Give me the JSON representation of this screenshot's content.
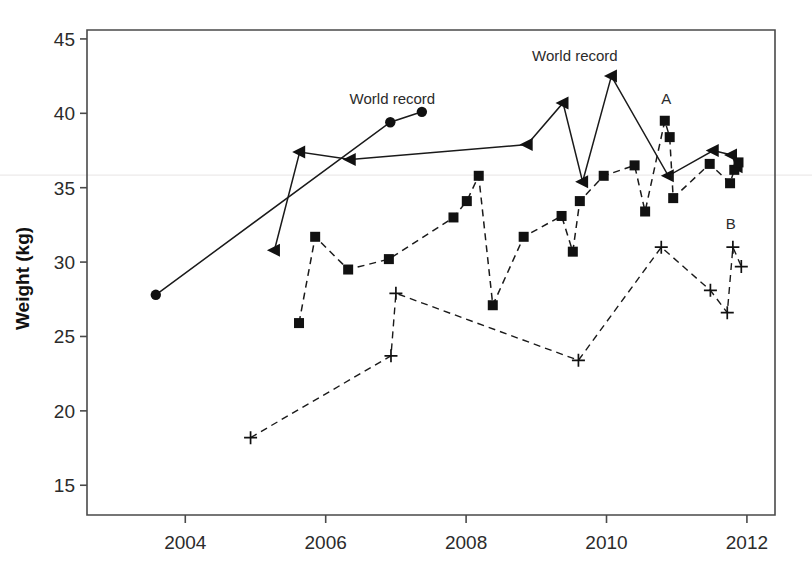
{
  "chart_data": {
    "type": "line",
    "title": "",
    "xlabel": "",
    "ylabel": "Weight (kg)",
    "xlim": [
      2002.6,
      2012.4
    ],
    "ylim": [
      13.0,
      45.6
    ],
    "xticks": [
      2004,
      2006,
      2008,
      2010,
      2012
    ],
    "xticklabels": [
      "2004",
      "2006",
      "2008",
      "2010",
      "2012"
    ],
    "yticks": [
      15,
      20,
      25,
      30,
      35,
      40,
      45
    ],
    "yticklabels": [
      "15",
      "20",
      "25",
      "30",
      "35",
      "40",
      "45"
    ],
    "grid": false,
    "legend": "none",
    "annotations": [
      {
        "text": "World record",
        "x": 2006.95,
        "y": 40.6,
        "target_series": "circles"
      },
      {
        "text": "World record",
        "x": 2009.55,
        "y": 43.5,
        "target_series": "triangles"
      },
      {
        "text": "A",
        "x": 2010.85,
        "y": 40.6,
        "target_series": "squares"
      },
      {
        "text": "B",
        "x": 2011.77,
        "y": 32.2,
        "target_series": "plus"
      }
    ],
    "series": [
      {
        "name": "circles",
        "marker": "circle",
        "linestyle": "solid",
        "color": "#111111",
        "points": [
          {
            "x": 2003.58,
            "y": 27.8
          },
          {
            "x": 2006.92,
            "y": 39.4
          },
          {
            "x": 2007.37,
            "y": 40.1
          }
        ]
      },
      {
        "name": "triangles",
        "marker": "left-triangle",
        "linestyle": "solid",
        "color": "#111111",
        "points": [
          {
            "x": 2005.27,
            "y": 30.8
          },
          {
            "x": 2005.63,
            "y": 37.4
          },
          {
            "x": 2006.35,
            "y": 36.9
          },
          {
            "x": 2008.87,
            "y": 37.9
          },
          {
            "x": 2009.38,
            "y": 40.7
          },
          {
            "x": 2009.66,
            "y": 35.4
          },
          {
            "x": 2010.07,
            "y": 42.5
          },
          {
            "x": 2010.88,
            "y": 35.8
          },
          {
            "x": 2011.52,
            "y": 37.5
          },
          {
            "x": 2011.78,
            "y": 37.2
          },
          {
            "x": 2011.86,
            "y": 36.4
          }
        ]
      },
      {
        "name": "squares",
        "marker": "square",
        "linestyle": "dashed",
        "color": "#111111",
        "points": [
          {
            "x": 2005.62,
            "y": 25.9
          },
          {
            "x": 2005.85,
            "y": 31.7
          },
          {
            "x": 2006.32,
            "y": 29.5
          },
          {
            "x": 2006.9,
            "y": 30.2
          },
          {
            "x": 2007.82,
            "y": 33.0
          },
          {
            "x": 2008.01,
            "y": 34.1
          },
          {
            "x": 2008.18,
            "y": 35.8
          },
          {
            "x": 2008.38,
            "y": 27.1
          },
          {
            "x": 2008.82,
            "y": 31.7
          },
          {
            "x": 2009.36,
            "y": 33.1
          },
          {
            "x": 2009.52,
            "y": 30.7
          },
          {
            "x": 2009.62,
            "y": 34.1
          },
          {
            "x": 2009.96,
            "y": 35.8
          },
          {
            "x": 2010.4,
            "y": 36.5
          },
          {
            "x": 2010.55,
            "y": 33.4
          },
          {
            "x": 2010.83,
            "y": 39.5
          },
          {
            "x": 2010.9,
            "y": 38.4
          },
          {
            "x": 2010.95,
            "y": 34.3
          },
          {
            "x": 2011.47,
            "y": 36.6
          },
          {
            "x": 2011.76,
            "y": 35.3
          },
          {
            "x": 2011.82,
            "y": 36.2
          },
          {
            "x": 2011.88,
            "y": 36.7
          }
        ]
      },
      {
        "name": "plus",
        "marker": "plus",
        "linestyle": "dashed",
        "color": "#111111",
        "points": [
          {
            "x": 2004.93,
            "y": 18.2
          },
          {
            "x": 2006.93,
            "y": 23.7
          },
          {
            "x": 2007.0,
            "y": 27.9
          },
          {
            "x": 2009.6,
            "y": 23.4
          },
          {
            "x": 2010.78,
            "y": 31.0
          },
          {
            "x": 2011.48,
            "y": 28.1
          },
          {
            "x": 2011.72,
            "y": 26.6
          },
          {
            "x": 2011.8,
            "y": 31.0
          },
          {
            "x": 2011.92,
            "y": 29.7
          }
        ]
      }
    ]
  },
  "figure": {
    "background": "#ffffff",
    "axis_color": "#4a4a4a",
    "data_color": "#111111"
  }
}
